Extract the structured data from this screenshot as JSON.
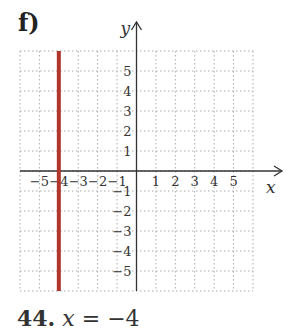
{
  "part_label": "f)",
  "problem": {
    "number": "44.",
    "variable": "x",
    "equals": " = ",
    "value": "−4"
  },
  "colors": {
    "line": "#b0362c",
    "axis": "#333333",
    "grid": "#aaaaaa"
  },
  "chart_data": {
    "type": "line",
    "title": "f)",
    "xlabel": "x",
    "ylabel": "y",
    "xlim": [
      -6,
      6
    ],
    "ylim": [
      -6,
      6
    ],
    "grid": true,
    "x_tick_labels": [
      "−5",
      "−4",
      "−3",
      "−2",
      "−1",
      "1",
      "2",
      "3",
      "4",
      "5"
    ],
    "y_tick_labels": [
      "5",
      "4",
      "3",
      "2",
      "1",
      "−1",
      "−2",
      "−3",
      "−4",
      "−5"
    ],
    "series": [
      {
        "name": "x = −4",
        "x": [
          -4,
          -4
        ],
        "y": [
          -6,
          6
        ],
        "color": "#b0362c"
      }
    ],
    "caption": "44. x = −4"
  }
}
